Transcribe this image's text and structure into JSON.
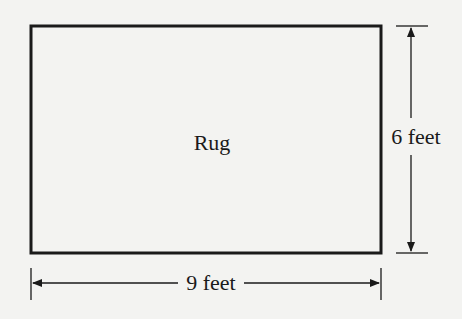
{
  "diagram": {
    "shape_label": "Rug",
    "height_label": "6 feet",
    "width_label": "9 feet",
    "colors": {
      "background": "#f3f3f1",
      "stroke": "#1a1a1a"
    }
  }
}
